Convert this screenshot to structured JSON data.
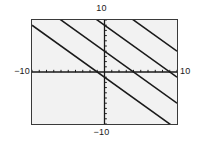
{
  "chart_data": {
    "type": "line",
    "title": "",
    "xlabel": "",
    "ylabel": "",
    "xlim": [
      -10,
      10
    ],
    "ylim": [
      -10,
      10
    ],
    "grid": false,
    "legend": null,
    "axes": {
      "x_axis_at_y": 0,
      "y_axis_at_x": 0,
      "tick_interval": 1,
      "tick_style": "small-marks-on-axis"
    },
    "labels": {
      "top": "10",
      "bottom": "−10",
      "left": "−10",
      "right": "10"
    },
    "series": [
      {
        "name": "y = -x + 14",
        "slope": -1,
        "intercept": 14,
        "x": [
          -10,
          10
        ],
        "values": [
          24,
          4
        ]
      },
      {
        "name": "y = -x + 9",
        "slope": -1,
        "intercept": 9,
        "x": [
          -10,
          10
        ],
        "values": [
          19,
          -1
        ]
      },
      {
        "name": "y = -x + 4",
        "slope": -1,
        "intercept": 4,
        "x": [
          -10,
          10
        ],
        "values": [
          14,
          -6
        ]
      },
      {
        "name": "y = -x - 1",
        "slope": -1,
        "intercept": -1,
        "x": [
          -10,
          10
        ],
        "values": [
          9,
          -11
        ]
      }
    ],
    "colors": {
      "line": "#1a1a1a",
      "axis": "#1a1a1a",
      "frame": "#3a3a3a",
      "plot_background": "#f2f2f2",
      "page_background": "#ffffff",
      "label_text": "#1a1a1a"
    }
  }
}
